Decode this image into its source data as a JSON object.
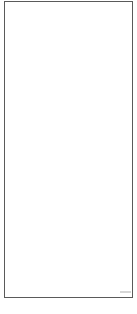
{
  "grid": {
    "columns": 4,
    "rows": 6,
    "line_color": "#5a5a5a",
    "cells": [
      [
        "",
        "",
        "",
        ""
      ],
      [
        "",
        "",
        "",
        ""
      ],
      [
        "",
        "",
        "",
        ""
      ],
      [
        "",
        "",
        "",
        ""
      ],
      [
        "",
        "",
        "",
        ""
      ],
      [
        "",
        "",
        "",
        ""
      ]
    ]
  },
  "mark": {
    "color": "#c8c8c8"
  }
}
